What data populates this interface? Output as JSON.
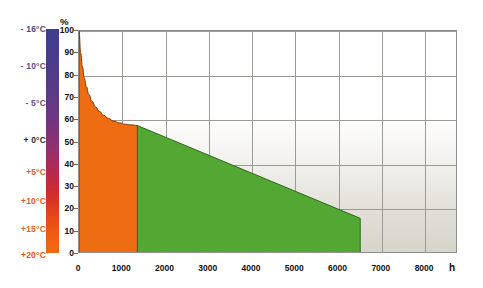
{
  "chart_data": {
    "type": "area",
    "title": "",
    "xlabel": "h",
    "ylabel": "%",
    "xlim": [
      0,
      8760
    ],
    "ylim": [
      0,
      100
    ],
    "grid": true,
    "legend": null,
    "x_ticks": [
      0,
      1000,
      2000,
      3000,
      4000,
      5000,
      6000,
      7000,
      8000
    ],
    "x_tick_labels": [
      "0",
      "1000",
      "2000",
      "3000",
      "4000",
      "5000",
      "6000",
      "7000",
      "8000"
    ],
    "y_ticks": [
      0,
      10,
      20,
      30,
      40,
      50,
      60,
      70,
      80,
      90,
      100
    ],
    "y_tick_labels": [
      "0",
      "10",
      "20",
      "30",
      "40",
      "50",
      "60",
      "70",
      "80",
      "90",
      "100"
    ],
    "y_gridlines": [
      20,
      40,
      60,
      80,
      100
    ],
    "series": [
      {
        "name": "orange-segment",
        "color": "#ee6d12",
        "x_range": [
          0,
          1350
        ],
        "points": [
          [
            0,
            100
          ],
          [
            40,
            90
          ],
          [
            80,
            84
          ],
          [
            120,
            79
          ],
          [
            170,
            75
          ],
          [
            230,
            71.5
          ],
          [
            300,
            68.5
          ],
          [
            380,
            66
          ],
          [
            470,
            64
          ],
          [
            570,
            62.2
          ],
          [
            680,
            60.8
          ],
          [
            800,
            59.6
          ],
          [
            930,
            58.8
          ],
          [
            1070,
            58.2
          ],
          [
            1210,
            57.9
          ],
          [
            1350,
            57.6
          ]
        ]
      },
      {
        "name": "green-segment",
        "color": "#52a832",
        "x_range": [
          1350,
          6500
        ],
        "points": [
          [
            1350,
            57.6
          ],
          [
            6500,
            16.0
          ],
          [
            6500,
            0
          ]
        ]
      }
    ],
    "annotations": [
      {
        "label": "segment-boundary",
        "x": 1350,
        "y_top": 57.6
      },
      {
        "label": "end-of-data",
        "x": 6500,
        "y_top": 16.0
      }
    ],
    "colorbar": {
      "name": "temperature-scale",
      "unit": "°C",
      "top_value": "- 16°C",
      "bottom_value": "+20°C",
      "labels": [
        {
          "text": "- 16°C",
          "color": "#4a4a80",
          "top": 29
        },
        {
          "text": "- 10°C",
          "color": "#5a5285",
          "top": 66
        },
        {
          "text": "- 5°C",
          "color": "#6a4a80",
          "top": 103
        },
        {
          "text": "+ 0°C",
          "color": "#2b2b2b",
          "top": 140
        },
        {
          "text": "+5°C",
          "color": "#e0603a",
          "top": 172
        },
        {
          "text": "+10°C",
          "color": "#ee5a28",
          "top": 201
        },
        {
          "text": "+15°C",
          "color": "#f0601e",
          "top": 229
        },
        {
          "text": "+20°C",
          "color": "#f4500c",
          "top": 255
        }
      ],
      "gradient_stops": [
        "#3d3f8f",
        "#5b3a87",
        "#8f3070",
        "#cc2a32",
        "#f26a10"
      ]
    },
    "colors": {
      "orange": "#ee6d12",
      "green": "#52a832",
      "plot_border": "#8e8e8e",
      "gridline": "#9a9a97",
      "background_top": "#ffffff",
      "background_bottom": "#d7d4cb"
    }
  }
}
